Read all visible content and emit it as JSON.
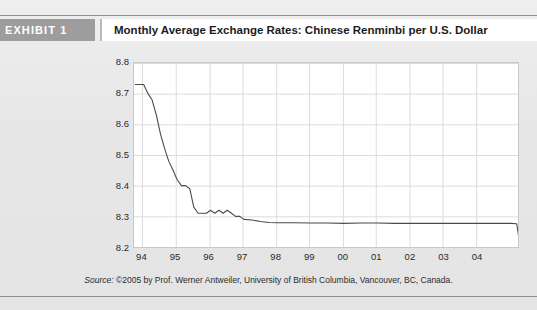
{
  "header": {
    "exhibit_label": "EXHIBIT 1",
    "title": "Monthly Average Exchange Rates: Chinese Renminbi per U.S. Dollar"
  },
  "source": {
    "label": "Source:",
    "text": "©2005 by Prof. Werner Antweiler, University of British Columbia, Vancouver, BC, Canada."
  },
  "colors": {
    "page_background": "#e7e7e7",
    "exhibit_tag_background": "#9d9d9d",
    "exhibit_tag_text": "#ffffff",
    "title_background": "#ffffff",
    "plot_background": "#ffffff",
    "gridline": "#dcdcdc",
    "plot_border": "#c8c8c8",
    "series_line": "#4a4a4a",
    "rule": "#8d8d8d"
  },
  "chart_data": {
    "type": "line",
    "title": "Monthly Average Exchange Rates: Chinese Renminbi per U.S. Dollar",
    "xlabel": "",
    "ylabel": "",
    "grid": true,
    "legend": false,
    "ylim": [
      8.2,
      8.8
    ],
    "yticks": [
      8.8,
      8.7,
      8.6,
      8.5,
      8.4,
      8.3,
      8.2
    ],
    "xlim": [
      1993.75,
      2005.25
    ],
    "xticks": [
      1994,
      1995,
      1996,
      1997,
      1998,
      1999,
      2000,
      2001,
      2002,
      2003,
      2004
    ],
    "xticklabels": [
      "94",
      "95",
      "96",
      "97",
      "98",
      "99",
      "00",
      "01",
      "02",
      "03",
      "04"
    ],
    "series": [
      {
        "name": "CNY per USD",
        "x": [
          1993.79,
          1993.92,
          1994.04,
          1994.17,
          1994.29,
          1994.42,
          1994.54,
          1994.67,
          1994.79,
          1994.92,
          1995.04,
          1995.17,
          1995.29,
          1995.42,
          1995.54,
          1995.67,
          1995.79,
          1995.92,
          1996.04,
          1996.17,
          1996.29,
          1996.42,
          1996.54,
          1996.67,
          1996.79,
          1996.92,
          1997.04,
          1997.29,
          1997.54,
          1997.79,
          1998.04,
          1998.54,
          1999.04,
          1999.54,
          2000.04,
          2000.54,
          2001.04,
          2001.54,
          2002.04,
          2002.54,
          2003.04,
          2003.54,
          2004.04,
          2004.54,
          2005.04,
          2005.21,
          2005.29
        ],
        "y": [
          8.73,
          8.73,
          8.73,
          8.7,
          8.68,
          8.63,
          8.57,
          8.52,
          8.48,
          8.45,
          8.42,
          8.4,
          8.4,
          8.39,
          8.33,
          8.31,
          8.31,
          8.31,
          8.32,
          8.31,
          8.32,
          8.31,
          8.32,
          8.31,
          8.3,
          8.3,
          8.29,
          8.288,
          8.283,
          8.28,
          8.279,
          8.279,
          8.278,
          8.278,
          8.277,
          8.278,
          8.278,
          8.277,
          8.277,
          8.277,
          8.277,
          8.277,
          8.277,
          8.277,
          8.277,
          8.276,
          8.22
        ]
      }
    ]
  }
}
